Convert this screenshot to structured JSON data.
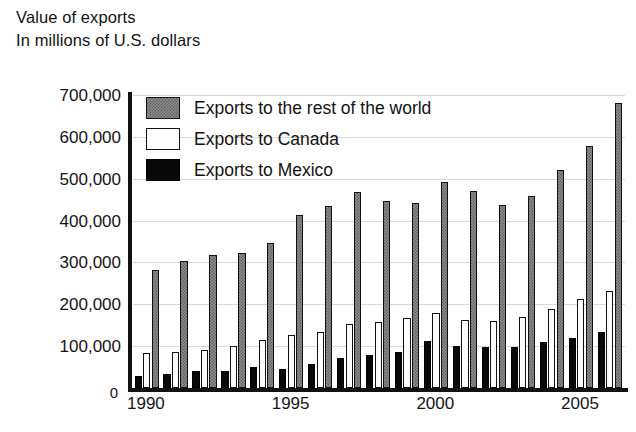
{
  "header": {
    "title_line1": "Value of exports",
    "title_line2": "In millions of U.S. dollars"
  },
  "legend": {
    "position": "inside-top-left",
    "items": [
      {
        "key": "world",
        "label": "Exports to the rest of the world",
        "color": "#8e8e8e",
        "pattern": "stipple"
      },
      {
        "key": "canada",
        "label": "Exports to Canada",
        "color": "#ffffff",
        "pattern": "solid"
      },
      {
        "key": "mexico",
        "label": "Exports to Mexico",
        "color": "#000000",
        "pattern": "solid"
      }
    ]
  },
  "axes": {
    "y_ticks": [
      "0",
      "100,000",
      "200,000",
      "300,000",
      "400,000",
      "500,000",
      "600,000",
      "700,000"
    ],
    "x_ticks": [
      "1990",
      "1995",
      "2000",
      "2005"
    ]
  },
  "chart_data": {
    "type": "bar",
    "title": "Value of exports",
    "subtitle": "In millions of U.S. dollars",
    "xlabel": "",
    "ylabel": "In millions of U.S. dollars",
    "ylim": [
      0,
      700000
    ],
    "ytick_step": 100000,
    "grid": true,
    "legend_position": "inside-top-left",
    "categories": [
      "1990",
      "1991",
      "1992",
      "1993",
      "1994",
      "1995",
      "1996",
      "1997",
      "1998",
      "1999",
      "2000",
      "2001",
      "2002",
      "2003",
      "2004",
      "2005",
      "2006"
    ],
    "x_tick_labels": [
      "1990",
      "1995",
      "2000",
      "2005"
    ],
    "series": [
      {
        "name": "Exports to Mexico",
        "color": "#000000",
        "values": [
          28300,
          33300,
          40600,
          41600,
          50800,
          46300,
          56800,
          71400,
          79000,
          87000,
          111300,
          101300,
          97500,
          97400,
          110800,
          120400,
          134200
        ]
      },
      {
        "name": "Exports to Canada",
        "color": "#ffffff",
        "values": [
          83700,
          85100,
          90600,
          100200,
          114400,
          127200,
          134200,
          151800,
          156600,
          166600,
          178900,
          163400,
          160900,
          169900,
          189900,
          211900,
          230700
        ]
      },
      {
        "name": "Exports to the rest of the world",
        "color": "#8e8e8e",
        "values": [
          281700,
          303500,
          317100,
          323400,
          347300,
          412900,
          434300,
          468300,
          447500,
          443100,
          493200,
          469500,
          438000,
          458100,
          520400,
          577600,
          679800
        ]
      }
    ]
  }
}
